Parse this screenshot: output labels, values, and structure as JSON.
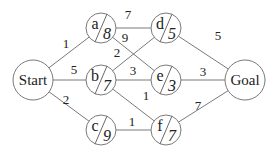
{
  "diagram": {
    "type": "weighted-graph",
    "nodes": [
      {
        "id": "Start",
        "label": "Start",
        "x": 33,
        "y": 80,
        "r": 20,
        "heuristic": null
      },
      {
        "id": "a",
        "label": "a",
        "x": 101,
        "y": 28,
        "r": 15,
        "heuristic": "8"
      },
      {
        "id": "b",
        "label": "b",
        "x": 101,
        "y": 80,
        "r": 15,
        "heuristic": "7"
      },
      {
        "id": "c",
        "label": "c",
        "x": 101,
        "y": 130,
        "r": 15,
        "heuristic": "9"
      },
      {
        "id": "d",
        "label": "d",
        "x": 166,
        "y": 28,
        "r": 15,
        "heuristic": "5"
      },
      {
        "id": "e",
        "label": "e",
        "x": 166,
        "y": 80,
        "r": 15,
        "heuristic": "3"
      },
      {
        "id": "f",
        "label": "f",
        "x": 166,
        "y": 130,
        "r": 15,
        "heuristic": "7"
      },
      {
        "id": "Goal",
        "label": "Goal",
        "x": 245,
        "y": 80,
        "r": 20,
        "heuristic": null
      }
    ],
    "edges": [
      {
        "from": "Start",
        "to": "a",
        "weight": "1",
        "lx": 66,
        "ly": 48
      },
      {
        "from": "Start",
        "to": "b",
        "weight": "5",
        "lx": 74,
        "ly": 74
      },
      {
        "from": "Start",
        "to": "c",
        "weight": "2",
        "lx": 66,
        "ly": 104
      },
      {
        "from": "a",
        "to": "d",
        "weight": "7",
        "lx": 128,
        "ly": 19
      },
      {
        "from": "a",
        "to": "e",
        "weight": "9",
        "lx": 125,
        "ly": 42
      },
      {
        "from": "b",
        "to": "d",
        "weight": "2",
        "lx": 117,
        "ly": 57
      },
      {
        "from": "b",
        "to": "e",
        "weight": "3",
        "lx": 133,
        "ly": 75
      },
      {
        "from": "b",
        "to": "f",
        "weight": "1",
        "lx": 146,
        "ly": 100
      },
      {
        "from": "c",
        "to": "f",
        "weight": "1",
        "lx": 132,
        "ly": 126
      },
      {
        "from": "d",
        "to": "Goal",
        "weight": "5",
        "lx": 218,
        "ly": 40
      },
      {
        "from": "e",
        "to": "Goal",
        "weight": "3",
        "lx": 203,
        "ly": 76
      },
      {
        "from": "f",
        "to": "Goal",
        "weight": "7",
        "lx": 198,
        "ly": 110
      }
    ]
  }
}
